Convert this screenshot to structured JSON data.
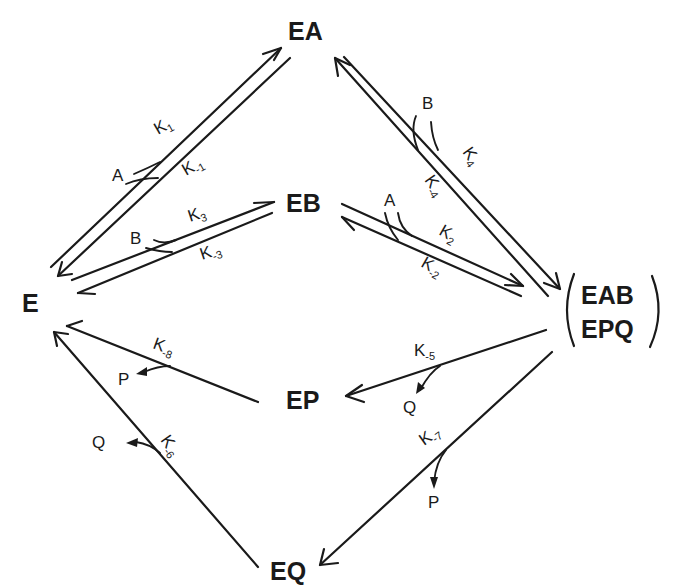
{
  "diagram": {
    "type": "reaction-mechanism",
    "nodes": {
      "E": "E",
      "EA": "EA",
      "EB": "EB",
      "EAB": "EAB",
      "EPQ": "EPQ",
      "EP": "EP",
      "EQ": "EQ"
    },
    "species": {
      "A_top": "A",
      "B_left": "B",
      "B_right": "B",
      "A_right": "A",
      "P_left": "P",
      "Q_left": "Q",
      "Q_right": "Q",
      "P_right": "P"
    },
    "rate_constants": {
      "k1": {
        "base": "K",
        "sub": "1"
      },
      "km1": {
        "base": "K",
        "sub": "-1"
      },
      "k3": {
        "base": "K",
        "sub": "3"
      },
      "km3": {
        "base": "K",
        "sub": "-3"
      },
      "k4": {
        "base": "K",
        "sub": "4"
      },
      "km4": {
        "base": "K",
        "sub": "-4"
      },
      "k2": {
        "base": "K",
        "sub": "2"
      },
      "km2": {
        "base": "K",
        "sub": "-2"
      },
      "km5": {
        "base": "K",
        "sub": "-5"
      },
      "km7": {
        "base": "K",
        "sub": "-7"
      },
      "km8": {
        "base": "K",
        "sub": "-8"
      },
      "km6": {
        "base": "K",
        "sub": "-6"
      }
    },
    "edges": [
      {
        "from": "E",
        "to": "EA",
        "forward": "k1",
        "reverse": "km1",
        "adds": "A"
      },
      {
        "from": "E",
        "to": "EB",
        "forward": "k3",
        "reverse": "km3",
        "adds": "B"
      },
      {
        "from": "EA",
        "to": "EAB/EPQ",
        "forward": "k4",
        "reverse": "km4",
        "adds": "B"
      },
      {
        "from": "EB",
        "to": "EAB/EPQ",
        "forward": "k2",
        "reverse": "km2",
        "adds": "A"
      },
      {
        "from": "EAB/EPQ",
        "to": "EP",
        "rate": "km5",
        "releases": "Q"
      },
      {
        "from": "EAB/EPQ",
        "to": "EQ",
        "rate": "km7",
        "releases": "P"
      },
      {
        "from": "EP",
        "to": "E",
        "rate": "km8",
        "releases": "P"
      },
      {
        "from": "EQ",
        "to": "E",
        "rate": "km6",
        "releases": "Q"
      }
    ],
    "colors": {
      "ink": "#1a1a1a",
      "background": "#ffffff"
    }
  }
}
